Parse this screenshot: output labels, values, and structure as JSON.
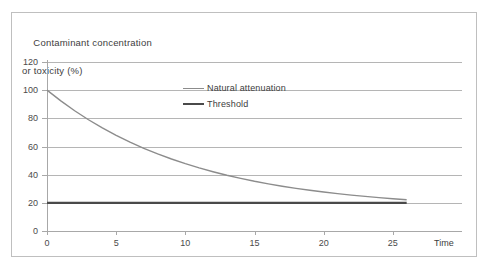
{
  "figure": {
    "y_axis_title_line1": "Contaminant concentration",
    "y_axis_title_line2": "or toxicity (%)",
    "x_axis_title": "Time"
  },
  "legend": {
    "position": "inside-top-center",
    "entries": [
      {
        "label": "Natural attenuation",
        "color": "#8c8c8c",
        "width": 1.4
      },
      {
        "label": "Threshold",
        "color": "#4a4a4a",
        "width": 2.4
      }
    ]
  },
  "chart_data": {
    "type": "line",
    "title": "",
    "subtitle": "",
    "xlabel": "Time",
    "ylabel": "Contaminant concentration or toxicity (%)",
    "xlim": [
      0,
      30
    ],
    "ylim": [
      0,
      120
    ],
    "xticks": [
      0,
      5,
      10,
      15,
      20,
      25
    ],
    "yticks": [
      0,
      20,
      40,
      60,
      80,
      100,
      120
    ],
    "xtick_labels": [
      "0",
      "5",
      "10",
      "15",
      "20",
      "25"
    ],
    "ytick_labels": [
      "0",
      "20",
      "40",
      "60",
      "80",
      "100",
      "120"
    ],
    "grid": "horizontal",
    "legend_position": "inside-top-center",
    "annotations": [],
    "series": [
      {
        "name": "Natural attenuation",
        "color": "#8c8c8c",
        "width": 1.4,
        "x": [
          0,
          1,
          2,
          3,
          4,
          5,
          6,
          7,
          8,
          9,
          10,
          11,
          12,
          13,
          14,
          15,
          16,
          17,
          18,
          19,
          20,
          21,
          22,
          23,
          24,
          25,
          26
        ],
        "y": [
          100.0,
          92.4,
          85.4,
          79.0,
          73.2,
          67.9,
          63.1,
          58.7,
          54.7,
          51.1,
          47.8,
          44.8,
          42.1,
          39.6,
          37.4,
          35.3,
          33.5,
          31.8,
          30.3,
          28.9,
          27.7,
          26.5,
          25.5,
          24.6,
          23.7,
          22.9,
          22.2
        ]
      },
      {
        "name": "Threshold",
        "color": "#4a4a4a",
        "width": 2.4,
        "x": [
          0,
          26
        ],
        "y": [
          20,
          20
        ]
      }
    ]
  }
}
